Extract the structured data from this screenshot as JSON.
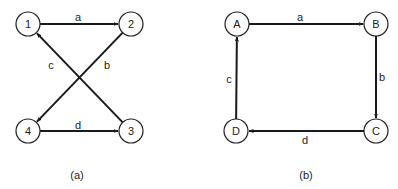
{
  "diagrams": [
    {
      "caption": "(a)",
      "caption_pos": [
        77,
        175
      ],
      "nodes": [
        {
          "id": "1",
          "label": "1",
          "x": 28,
          "y": 24
        },
        {
          "id": "2",
          "label": "2",
          "x": 131,
          "y": 24
        },
        {
          "id": "3",
          "label": "3",
          "x": 131,
          "y": 131
        },
        {
          "id": "4",
          "label": "4",
          "x": 28,
          "y": 131
        }
      ],
      "edges": [
        {
          "label": "a",
          "from": "1",
          "to": "2",
          "label_pos": [
            78,
            17
          ]
        },
        {
          "label": "b",
          "from": "2",
          "to": "4",
          "label_pos": [
            107,
            65
          ]
        },
        {
          "label": "c",
          "from": "3",
          "to": "1",
          "label_pos": [
            51,
            65
          ]
        },
        {
          "label": "d",
          "from": "4",
          "to": "3",
          "label_pos": [
            78,
            125
          ]
        }
      ]
    },
    {
      "caption": "(b)",
      "caption_pos": [
        306,
        175
      ],
      "nodes": [
        {
          "id": "A",
          "label": "A",
          "x": 237,
          "y": 24
        },
        {
          "id": "B",
          "label": "B",
          "x": 376,
          "y": 24
        },
        {
          "id": "C",
          "label": "C",
          "x": 376,
          "y": 131
        },
        {
          "id": "D",
          "label": "D",
          "x": 236,
          "y": 131
        }
      ],
      "edges": [
        {
          "label": "a",
          "from": "A",
          "to": "B",
          "label_pos": [
            300,
            17
          ]
        },
        {
          "label": "b",
          "from": "B",
          "to": "C",
          "label_pos": [
            382,
            77
          ]
        },
        {
          "label": "c",
          "from": "D",
          "to": "A",
          "label_pos": [
            229,
            79
          ]
        },
        {
          "label": "d",
          "from": "C",
          "to": "D",
          "label_pos": [
            305,
            140
          ]
        }
      ]
    }
  ],
  "style": {
    "node_radius": 12,
    "stroke": "#1a1a1a",
    "background": "#ffffff"
  }
}
